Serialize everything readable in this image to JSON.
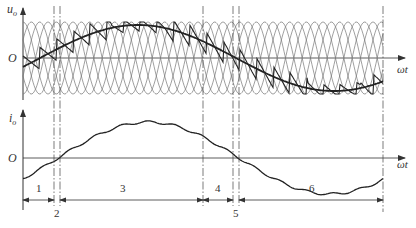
{
  "figure": {
    "title": "",
    "top_panel": {
      "y_label": "u",
      "y_label_sub": "o",
      "origin_label": "O",
      "x_label": "ωt"
    },
    "bottom_panel": {
      "y_label": "i",
      "y_label_sub": "o",
      "origin_label": "O",
      "x_label": "ωt"
    },
    "intervals": [
      {
        "label": "1",
        "position": "above"
      },
      {
        "label": "2",
        "position": "below"
      },
      {
        "label": "3",
        "position": "above"
      },
      {
        "label": "4",
        "position": "above"
      },
      {
        "label": "5",
        "position": "below"
      },
      {
        "label": "6",
        "position": "above"
      }
    ],
    "colors": {
      "ink": "#333333",
      "thin": "#777777",
      "background": "#ffffff"
    }
  }
}
